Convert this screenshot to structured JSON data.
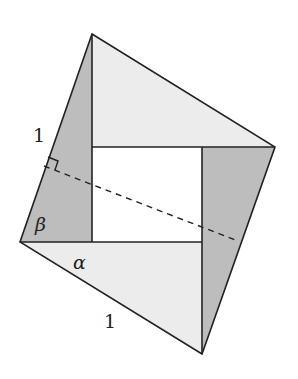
{
  "figure": {
    "colors": {
      "light_fill": "#ececec",
      "dark_fill": "#bdbdbd",
      "hole_fill": "#ffffff",
      "stroke": "#222222"
    },
    "outer_vertices": {
      "top": [
        92,
        34
      ],
      "right": [
        275,
        147
      ],
      "bottom": [
        202,
        354
      ],
      "left": [
        20,
        242
      ]
    },
    "inner_rectangle": {
      "top_left": [
        92,
        147
      ],
      "top_right": [
        202,
        147
      ],
      "bottom_right": [
        202,
        242
      ],
      "bottom_left": [
        92,
        242
      ]
    },
    "dashed_line": {
      "from": [
        44,
        166
      ],
      "to": [
        238,
        241
      ]
    },
    "labels": {
      "side_left": "1",
      "side_bottom": "1",
      "angle_beta": "β",
      "angle_alpha": "α"
    }
  }
}
